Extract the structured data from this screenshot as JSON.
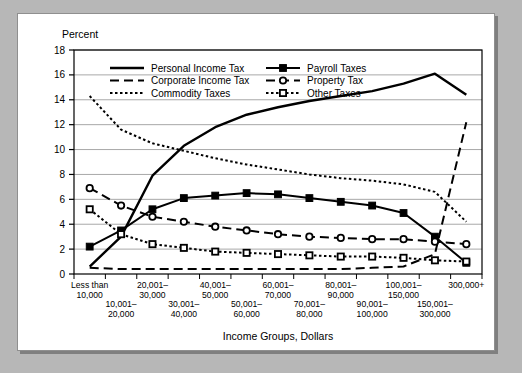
{
  "chart_data": {
    "type": "line",
    "title": "",
    "ylabel": "Percent",
    "xlabel": "Income Groups, Dollars",
    "ylim": [
      0,
      18
    ],
    "yticks": [
      0,
      2,
      4,
      6,
      8,
      10,
      12,
      14,
      16,
      18
    ],
    "grid": true,
    "legend_position": "top-left-inside",
    "categories": [
      "Less than 10,000",
      "10,001–20,000",
      "20,001–30,000",
      "30,001–40,000",
      "40,001–50,000",
      "50,001–60,000",
      "60,001–70,000",
      "70,001–80,000",
      "80,001–90,000",
      "90,001–100,000",
      "100,001–150,000",
      "150,001–300,000",
      "300,000+"
    ],
    "category_lines": [
      [
        "Less than",
        "10,000"
      ],
      [
        "10,001–",
        "20,000"
      ],
      [
        "20,001–",
        "30,000"
      ],
      [
        "30,001–",
        "40,000"
      ],
      [
        "40,001–",
        "50,000"
      ],
      [
        "50,001–",
        "60,000"
      ],
      [
        "60,001–",
        "70,000"
      ],
      [
        "70,001–",
        "80,000"
      ],
      [
        "80,001–",
        "90,000"
      ],
      [
        "90,001–",
        "100,000"
      ],
      [
        "100,001–",
        "150,000"
      ],
      [
        "150,001–",
        "300,000"
      ],
      [
        "300,000+",
        ""
      ]
    ],
    "series": [
      {
        "name": "Personal Income Tax",
        "style": "solid",
        "marker": "none",
        "values": [
          0.6,
          3.0,
          7.9,
          10.3,
          11.8,
          12.8,
          13.4,
          13.9,
          14.3,
          14.7,
          15.3,
          16.1,
          14.4
        ]
      },
      {
        "name": "Corporate Income Tax",
        "style": "dashed",
        "marker": "none",
        "values": [
          0.5,
          0.4,
          0.4,
          0.4,
          0.4,
          0.4,
          0.4,
          0.4,
          0.4,
          0.5,
          0.6,
          1.6,
          12.2
        ]
      },
      {
        "name": "Commodity Taxes",
        "style": "dotted",
        "marker": "none",
        "values": [
          14.3,
          11.6,
          10.5,
          9.9,
          9.3,
          8.8,
          8.4,
          8.0,
          7.7,
          7.5,
          7.2,
          6.6,
          4.2
        ]
      },
      {
        "name": "Payroll Taxes",
        "style": "solid",
        "marker": "filled-square",
        "values": [
          2.2,
          3.5,
          5.2,
          6.1,
          6.3,
          6.5,
          6.4,
          6.1,
          5.8,
          5.5,
          4.9,
          3.0,
          0.9
        ]
      },
      {
        "name": "Property Tax",
        "style": "dashed",
        "marker": "open-circle",
        "values": [
          6.9,
          5.5,
          4.6,
          4.2,
          3.8,
          3.5,
          3.2,
          3.0,
          2.9,
          2.8,
          2.8,
          2.6,
          2.4
        ]
      },
      {
        "name": "Other Taxes",
        "style": "dotted",
        "marker": "open-square",
        "values": [
          5.2,
          3.2,
          2.4,
          2.1,
          1.8,
          1.7,
          1.6,
          1.5,
          1.4,
          1.4,
          1.3,
          1.1,
          1.0
        ]
      }
    ]
  }
}
